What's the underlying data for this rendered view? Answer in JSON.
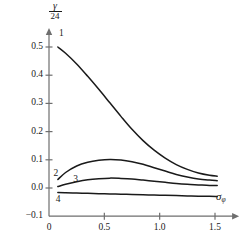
{
  "chart_data": {
    "type": "line",
    "title": "",
    "subtitle": "",
    "xlabel": "σφ",
    "xlabel_base": "σ",
    "xlabel_sub": "φ",
    "ylabel": "γ/24",
    "ylabel_numerator": "γ",
    "ylabel_denominator": "24",
    "xlim": [
      0,
      1.72
    ],
    "ylim": [
      -0.1,
      0.56
    ],
    "xticks": [
      0,
      0.5,
      1.0,
      1.5
    ],
    "xtick_labels": [
      "0",
      "0.5",
      "1.0",
      "1.5"
    ],
    "yticks": [
      -0.1,
      0.0,
      0.1,
      0.2,
      0.3,
      0.4,
      0.5
    ],
    "ytick_labels": [
      "−0.1",
      "0.0",
      "0.1",
      "0.2",
      "0.3",
      "0.4",
      "0.5"
    ],
    "grid": false,
    "legend_position": "inline-curve-labels",
    "line_color": "#1a1a1a",
    "axis_color": "#6e6e6e",
    "background": "#ffffff",
    "annotations": [
      {
        "text": "1",
        "x": 0.09,
        "y": 0.545,
        "curve": 1
      },
      {
        "text": "2",
        "x": 0.04,
        "y": 0.048,
        "curve": 2
      },
      {
        "text": "3",
        "x": 0.22,
        "y": 0.028,
        "curve": 3
      },
      {
        "text": "4",
        "x": 0.06,
        "y": -0.042,
        "curve": 4
      }
    ],
    "series": [
      {
        "name": "1",
        "label": "1",
        "x": [
          0.08,
          0.15,
          0.25,
          0.35,
          0.45,
          0.55,
          0.65,
          0.75,
          0.85,
          0.95,
          1.05,
          1.15,
          1.25,
          1.35,
          1.45,
          1.52
        ],
        "values": [
          0.5,
          0.478,
          0.44,
          0.396,
          0.35,
          0.302,
          0.254,
          0.208,
          0.168,
          0.134,
          0.106,
          0.083,
          0.066,
          0.053,
          0.045,
          0.042
        ]
      },
      {
        "name": "2",
        "label": "2",
        "x": [
          0.08,
          0.15,
          0.25,
          0.35,
          0.45,
          0.55,
          0.65,
          0.75,
          0.85,
          0.95,
          1.05,
          1.15,
          1.25,
          1.35,
          1.45,
          1.52
        ],
        "values": [
          0.03,
          0.055,
          0.078,
          0.091,
          0.098,
          0.101,
          0.099,
          0.093,
          0.084,
          0.072,
          0.06,
          0.048,
          0.039,
          0.032,
          0.028,
          0.026
        ]
      },
      {
        "name": "3",
        "label": "3",
        "x": [
          0.08,
          0.15,
          0.25,
          0.35,
          0.45,
          0.55,
          0.65,
          0.75,
          0.85,
          0.95,
          1.05,
          1.15,
          1.25,
          1.35,
          1.45,
          1.52
        ],
        "values": [
          0.005,
          0.013,
          0.022,
          0.029,
          0.033,
          0.035,
          0.034,
          0.032,
          0.028,
          0.024,
          0.02,
          0.016,
          0.013,
          0.011,
          0.009,
          0.009
        ]
      },
      {
        "name": "4",
        "label": "4",
        "x": [
          0.08,
          0.15,
          0.25,
          0.35,
          0.45,
          0.55,
          0.65,
          0.75,
          0.85,
          0.95,
          1.05,
          1.15,
          1.25,
          1.35,
          1.45,
          1.52
        ],
        "values": [
          -0.016,
          -0.017,
          -0.018,
          -0.019,
          -0.02,
          -0.021,
          -0.022,
          -0.023,
          -0.024,
          -0.025,
          -0.026,
          -0.027,
          -0.028,
          -0.029,
          -0.029,
          -0.03
        ]
      }
    ]
  }
}
